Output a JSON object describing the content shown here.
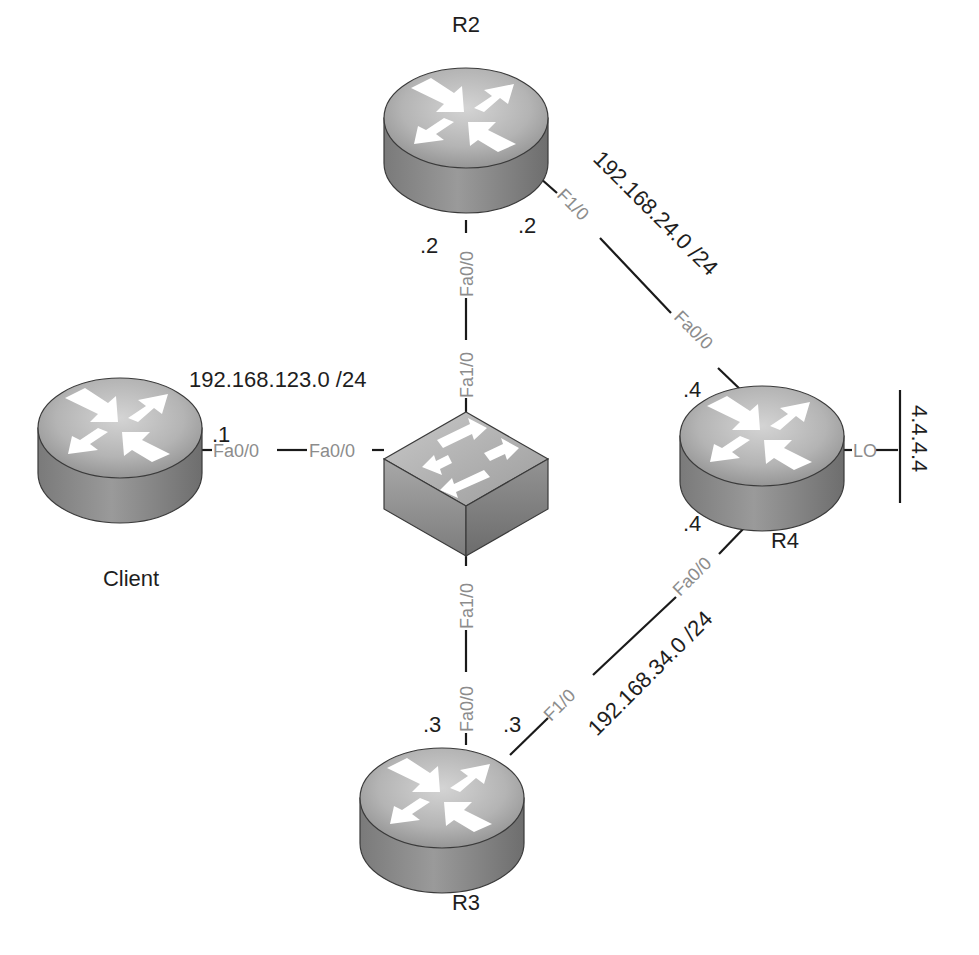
{
  "diagram": {
    "type": "network-topology",
    "devices": [
      {
        "id": "R2",
        "label": "R2",
        "kind": "router"
      },
      {
        "id": "R3",
        "label": "R3",
        "kind": "router"
      },
      {
        "id": "R4",
        "label": "R4",
        "kind": "router"
      },
      {
        "id": "Client",
        "label": "Client",
        "kind": "router"
      },
      {
        "id": "SW",
        "label": "",
        "kind": "switch"
      }
    ],
    "networks": {
      "lan123": "192.168.123.0 /24",
      "link24": "192.168.24.0 /24",
      "link34": "192.168.34.0 /24",
      "loopback": "4.4.4.4"
    },
    "links": [
      {
        "a": "Client",
        "a_if": "Fa0/0",
        "a_ip": ".1",
        "b": "SW",
        "b_if": "Fa0/0"
      },
      {
        "a": "R2",
        "a_if": "Fa0/0",
        "a_ip": ".2",
        "b": "SW",
        "b_if": "Fa1/0"
      },
      {
        "a": "R3",
        "a_if": "Fa0/0",
        "a_ip": ".3",
        "b": "SW",
        "b_if": "Fa1/0"
      },
      {
        "a": "R2",
        "a_if": "F1/0",
        "a_ip": ".2",
        "b": "R4",
        "b_if": "Fa0/0",
        "b_ip": ".4"
      },
      {
        "a": "R3",
        "a_if": "F1/0",
        "a_ip": ".3",
        "b": "R4",
        "b_if": "Fa0/0",
        "b_ip": ".4"
      },
      {
        "a": "R4",
        "a_if": "L0",
        "b": "loopback"
      }
    ],
    "labels": {
      "r2": "R2",
      "r3": "R3",
      "r4": "R4",
      "client": "Client",
      "client_ip": ".1",
      "r2_fa00_ip": ".2",
      "r2_f10_ip": ".2",
      "r3_fa00_ip": ".3",
      "r3_f10_ip": ".3",
      "r4_top_ip": ".4",
      "r4_bottom_ip": ".4",
      "if_client_fa00": "Fa0/0",
      "if_sw_fa00": "Fa0/0",
      "if_r2_fa00": "Fa0/0",
      "if_sw_fa10_top": "Fa1/0",
      "if_sw_fa10_bottom": "Fa1/0",
      "if_r3_fa00": "Fa0/0",
      "if_r2_f10": "F1/0",
      "if_r4_fa00_top": "Fa0/0",
      "if_r3_f10": "F1/0",
      "if_r4_fa00_bottom": "Fa0/0",
      "if_r4_lo": "LO"
    },
    "colors": {
      "line": "#1a1a1a",
      "interface_text": "#8c8c8c",
      "label_text": "#1e1e1e",
      "device_top": "#b5b5b5",
      "device_side": "#8a8a8a"
    }
  }
}
